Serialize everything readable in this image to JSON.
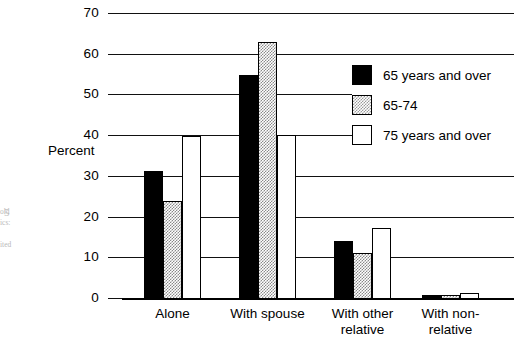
{
  "chart_data": {
    "type": "bar",
    "title": "",
    "subtitle": "",
    "xlabel": "",
    "ylabel": "Percent",
    "ylim": [
      0,
      70
    ],
    "yticks": [
      0,
      10,
      20,
      30,
      40,
      50,
      60,
      70
    ],
    "ytick_labels": [
      "0",
      "10",
      "20",
      "30",
      "40",
      "50",
      "60",
      "70"
    ],
    "grid": "horizontal",
    "legend_position": "upper right",
    "categories": [
      "Alone",
      "With spouse",
      "With other\nrelative",
      "With non-\nrelative"
    ],
    "series": [
      {
        "name": "65 years and over",
        "fill": "solid-black",
        "color": "#000000",
        "values": [
          31.5,
          55.0,
          14.3,
          1.1
        ]
      },
      {
        "name": "65-74",
        "fill": "dotted-gray",
        "color": "#d9d9d9",
        "values": [
          24.0,
          63.2,
          11.2,
          0.9
        ]
      },
      {
        "name": "75 years and over",
        "fill": "white",
        "color": "#ffffff",
        "values": [
          40.0,
          40.2,
          17.4,
          1.4
        ]
      }
    ]
  },
  "axis": {
    "y_title": "Percent"
  },
  "legend": {
    "entries": [
      {
        "label": "65 years and over"
      },
      {
        "label": "65-74"
      },
      {
        "label": "75 years and over"
      }
    ]
  },
  "margin_note": {
    "page_number": "5",
    "text": "old\nics:\n\nited"
  }
}
